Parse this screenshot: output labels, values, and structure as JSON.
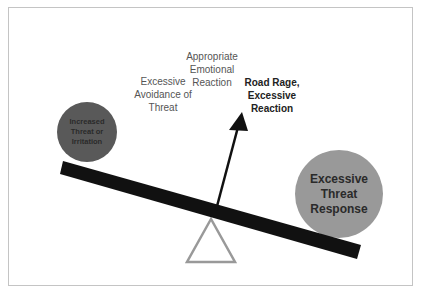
{
  "diagram": {
    "labels": {
      "avoidance": "Excessive Avoidance of Threat",
      "appropriate": "Appropriate Emotional Reaction",
      "road_rage": "Road Rage, Excessive Reaction"
    },
    "left_weight": {
      "label": "Increased Threat or Irritation",
      "color": "#595959"
    },
    "right_weight": {
      "label": "Excessive Threat Response",
      "color": "#999999"
    },
    "beam_color": "#111111",
    "fulcrum_color": "#999999",
    "arrow_color": "#111111"
  }
}
